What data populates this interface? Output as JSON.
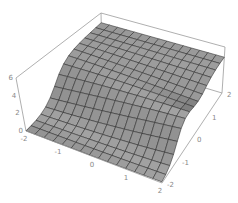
{
  "chart_data": {
    "type": "surface3d",
    "title": "",
    "xlabel": "",
    "ylabel": "",
    "zlabel": "",
    "x_range": [
      -2,
      2
    ],
    "y_range": [
      -2,
      2
    ],
    "z_range": [
      0,
      6
    ],
    "x_ticks": [
      "-2",
      "-1",
      "0",
      "1",
      "2"
    ],
    "y_ticks": [
      "-2",
      "-1",
      "0",
      "1",
      "2"
    ],
    "z_ticks": [
      "0",
      "2",
      "4",
      "6"
    ],
    "grid_resolution": 15,
    "surface_description": "Ridge surface: near 0 at front edge (y=-2), rising steeply to a plateau around z≈4-5 toward the back with a shallow saddle/dip across the middle",
    "surface_color": "#8c8c8c",
    "mesh_color": "#2b2b2b",
    "box_color": "#9a9a9a",
    "sample_z_values": {
      "y_values": [
        -2,
        -1,
        0,
        1,
        2
      ],
      "z_at_x_-2": [
        0.2,
        1.5,
        4.3,
        4.0,
        4.2
      ],
      "z_at_x_0": [
        0.1,
        0.8,
        3.2,
        3.6,
        4.0
      ],
      "z_at_x_2": [
        0.1,
        0.6,
        2.6,
        3.8,
        4.1
      ]
    }
  }
}
